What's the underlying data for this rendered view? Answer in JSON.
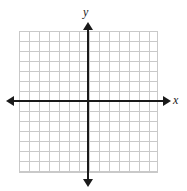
{
  "figure": {
    "kind": "blank-cartesian-coordinate-plane",
    "background_color": "#ffffff"
  },
  "axes": {
    "x_label": "x",
    "y_label": "y",
    "axis_color": "#1a1a1a",
    "origin": {
      "x": 88,
      "y": 101
    },
    "x_axis": {
      "arrow_left": true,
      "arrow_right": true,
      "start_x": 6,
      "end_x": 171
    },
    "y_axis": {
      "arrow_up": true,
      "arrow_down": true,
      "start_y": 22,
      "end_y": 187
    }
  },
  "grid": {
    "color": "#c9c9c9",
    "cell_size_px": 10,
    "columns": 14,
    "rows": 14,
    "left_px": 19,
    "top_px": 31,
    "width_px": 138,
    "height_px": 141,
    "columns_left_of_y_axis": 7,
    "columns_right_of_y_axis": 7,
    "rows_above_x_axis": 7,
    "rows_below_x_axis": 7,
    "tick_labels": [],
    "show_numbers": false
  },
  "chart_data": {
    "type": "scatter",
    "title": "",
    "xlabel": "x",
    "ylabel": "y",
    "series": [],
    "x": [],
    "xlim": [
      -7,
      7
    ],
    "ylim": [
      -7,
      7
    ],
    "grid": true,
    "legend": false,
    "annotations": []
  }
}
